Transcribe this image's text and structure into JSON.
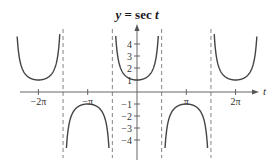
{
  "chart_data": {
    "type": "line",
    "title": "y = sec t",
    "title_parts": {
      "var": "y",
      "eq": " = sec ",
      "arg": "t"
    },
    "xlabel": "t",
    "ylabel": "",
    "function": "sec(t)",
    "xlim": [
      -8.2,
      7.7
    ],
    "ylim": [
      -5,
      5
    ],
    "x_ticks": [
      {
        "value": -6.2832,
        "label": "−2π"
      },
      {
        "value": -3.1416,
        "label": "−π"
      },
      {
        "value": 3.1416,
        "label": "π"
      },
      {
        "value": 6.2832,
        "label": "2π"
      }
    ],
    "y_ticks": [
      {
        "value": 4,
        "label": "4"
      },
      {
        "value": 3,
        "label": "3"
      },
      {
        "value": 2,
        "label": "2"
      },
      {
        "value": 1,
        "label": "1"
      },
      {
        "value": -1,
        "label": "−1"
      },
      {
        "value": -2,
        "label": "−2"
      },
      {
        "value": -3,
        "label": "−3"
      },
      {
        "value": -4,
        "label": "−4"
      }
    ],
    "asymptotes": [
      -4.7124,
      -1.5708,
      1.5708,
      4.7124
    ],
    "asymptote_labels": [
      "-3π/2",
      "-π/2",
      "π/2",
      "3π/2"
    ],
    "branches": [
      {
        "x_range": [
          -7.75,
          -4.7124
        ],
        "vertex": [
          -6.2832,
          1
        ],
        "opens": "up"
      },
      {
        "x_range": [
          -4.7124,
          -1.5708
        ],
        "vertex": [
          -3.1416,
          -1
        ],
        "opens": "down"
      },
      {
        "x_range": [
          -1.5708,
          1.5708
        ],
        "vertex": [
          0,
          1
        ],
        "opens": "up"
      },
      {
        "x_range": [
          1.5708,
          4.7124
        ],
        "vertex": [
          3.1416,
          -1
        ],
        "opens": "down"
      },
      {
        "x_range": [
          4.7124,
          7.75
        ],
        "vertex": [
          6.2832,
          1
        ],
        "opens": "up"
      }
    ],
    "sample_points": [
      {
        "t": -6.2832,
        "y": 1
      },
      {
        "t": -3.1416,
        "y": -1
      },
      {
        "t": 0,
        "y": 1
      },
      {
        "t": 3.1416,
        "y": -1
      },
      {
        "t": 6.2832,
        "y": 1
      }
    ],
    "grid": false,
    "legend": null
  }
}
